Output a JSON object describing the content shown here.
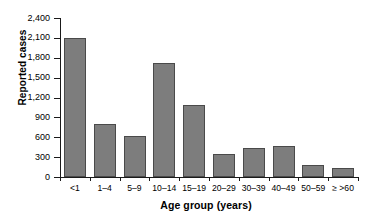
{
  "chart_data": {
    "type": "bar",
    "title": "",
    "xlabel": "Age group (years)",
    "ylabel": "Reported cases",
    "categories": [
      "<1",
      "1–4",
      "5–9",
      "10–14",
      "15–19",
      "20–29",
      "30–39",
      "40–49",
      "50–59",
      "≥ >60"
    ],
    "values": [
      2100,
      800,
      620,
      1720,
      1085,
      340,
      435,
      470,
      180,
      130
    ],
    "ylim": [
      0,
      2400
    ],
    "ytick_values": [
      0,
      300,
      600,
      900,
      1200,
      1500,
      1800,
      2100,
      2400
    ],
    "ytick_labels": [
      "0",
      "300",
      "600",
      "900",
      "1,200",
      "1,500",
      "1,800",
      "2,100",
      "2,400"
    ],
    "grid": false,
    "legend": null,
    "bar_color": "#7d7d7d",
    "bar_edge_color": "#4a4a4a",
    "axis_color": "#1a1a1a",
    "background": "#ffffff"
  }
}
